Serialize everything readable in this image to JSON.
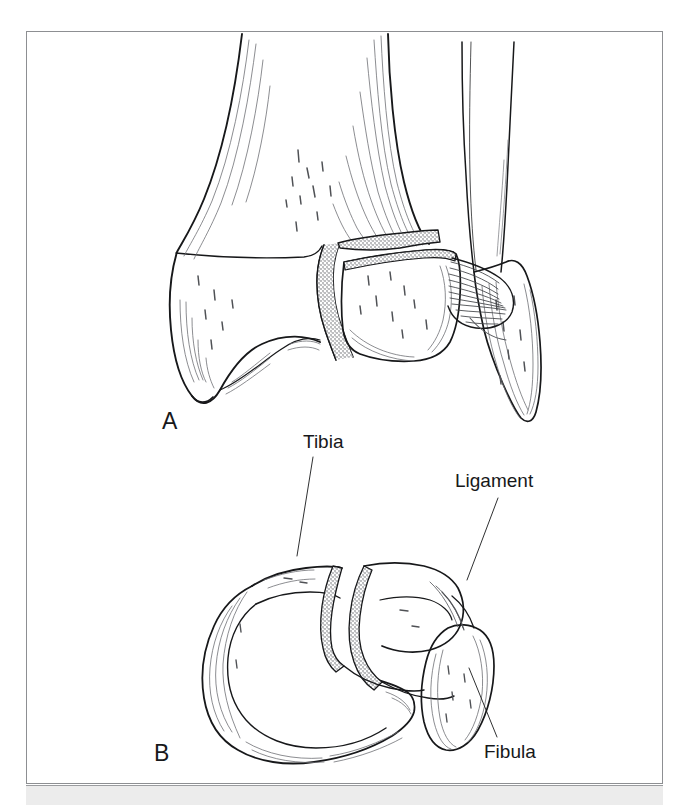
{
  "figure": {
    "kind": "anatomical-line-illustration",
    "panels": [
      {
        "id": "A",
        "letter": "A",
        "view": "anterior"
      },
      {
        "id": "B",
        "letter": "B",
        "view": "axial cross-section"
      }
    ],
    "labels": [
      {
        "id": "tibia",
        "text": "Tibia"
      },
      {
        "id": "ligament",
        "text": "Ligament"
      },
      {
        "id": "fibula",
        "text": "Fibula"
      }
    ],
    "colors": {
      "page_background": "#ffffff",
      "ink": "#17181a",
      "border": "#8d8f92",
      "footer": "#ececec",
      "hatch": "#5a5c60"
    }
  }
}
